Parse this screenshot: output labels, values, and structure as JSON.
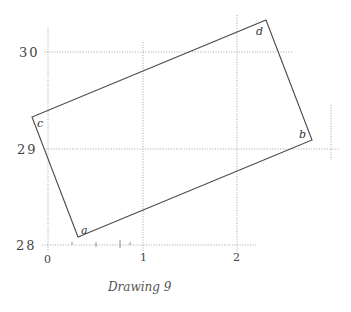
{
  "figure": {
    "caption": "Drawing 9",
    "y_axis": {
      "ticks": [
        {
          "label": "30",
          "y": 52
        },
        {
          "label": "29",
          "y": 149
        },
        {
          "label": "28",
          "y": 245
        }
      ]
    },
    "x_axis": {
      "ticks": [
        {
          "label": "0",
          "x": 48
        },
        {
          "label": "1",
          "x": 143
        },
        {
          "label": "2",
          "x": 237
        }
      ]
    },
    "rectangle": {
      "vertices": [
        {
          "label": "a",
          "x": 78,
          "y": 237
        },
        {
          "label": "b",
          "x": 312,
          "y": 140
        },
        {
          "label": "d",
          "x": 266,
          "y": 20
        },
        {
          "label": "c",
          "x": 32,
          "y": 117
        }
      ]
    },
    "colors": {
      "line": "#4a4a4a",
      "grid": "#9a9a9a",
      "background": "#ffffff"
    }
  }
}
